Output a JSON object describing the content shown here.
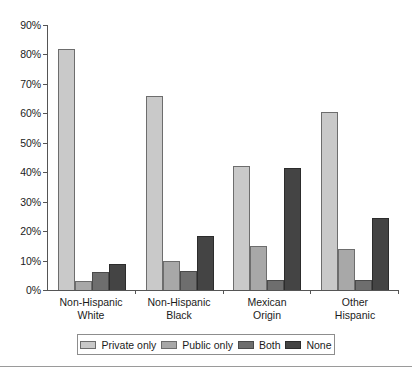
{
  "chart_data": {
    "type": "bar",
    "title": "",
    "xlabel": "",
    "ylabel": "",
    "ylim": [
      0,
      90
    ],
    "ytick_step": 10,
    "grid": false,
    "legend_position": "bottom",
    "ytick_labels": [
      "90%",
      "80%",
      "70%",
      "60%",
      "50%",
      "40%",
      "30%",
      "20%",
      "10%",
      "0%"
    ],
    "ytick_values": [
      90,
      80,
      70,
      60,
      50,
      40,
      30,
      20,
      10,
      0
    ],
    "categories": [
      {
        "line1": "Non-Hispanic",
        "line2": "White"
      },
      {
        "line1": "Non-Hispanic",
        "line2": "Black"
      },
      {
        "line1": "Mexican",
        "line2": "Origin"
      },
      {
        "line1": "Other",
        "line2": "Hispanic"
      }
    ],
    "series": [
      {
        "name": "Private only",
        "color": "#c9c9c9",
        "values": [
          82.0,
          65.8,
          42.0,
          60.5
        ]
      },
      {
        "name": "Public only",
        "color": "#a8a8a8",
        "values": [
          3.0,
          10.0,
          15.0,
          14.0
        ]
      },
      {
        "name": "Both",
        "color": "#6e6e6e",
        "values": [
          6.0,
          6.5,
          3.5,
          3.5
        ]
      },
      {
        "name": "None",
        "color": "#444444",
        "values": [
          9.0,
          18.5,
          41.5,
          24.5
        ]
      }
    ]
  },
  "legend": {
    "items": [
      {
        "label": "Private only"
      },
      {
        "label": "Public only"
      },
      {
        "label": "Both"
      },
      {
        "label": "None"
      }
    ]
  }
}
